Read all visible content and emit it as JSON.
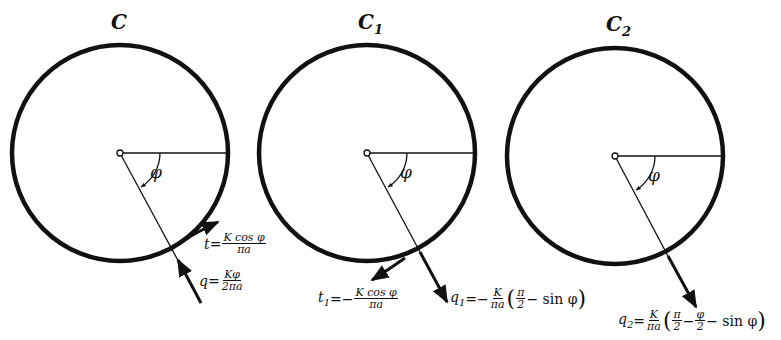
{
  "diagrams": [
    {
      "title": "C",
      "title_sub": "",
      "angle_label": "φ",
      "center": [
        120,
        153
      ],
      "radius": 108,
      "t_label": {
        "sym": "t",
        "sub": "",
        "eq": "=",
        "sign": "",
        "num": "K cos φ",
        "den": "πa"
      },
      "q_label": {
        "sym": "q",
        "sub": "",
        "eq": "=",
        "sign": "",
        "num": "Kφ",
        "den": "2πa"
      }
    },
    {
      "title": "C",
      "title_sub": "1",
      "angle_label": "φ",
      "center": [
        367,
        153
      ],
      "radius": 108,
      "t_label": {
        "sym": "t",
        "sub": "1",
        "eq": "=",
        "sign": "−",
        "num": "K cos φ",
        "den": "πa"
      },
      "q_label": {
        "sym": "q",
        "sub": "1",
        "eq": "=",
        "sign": "−",
        "num": "K",
        "den": "πa",
        "paren_open": "(",
        "inner_num": "π",
        "inner_den": "2",
        "tail": "− sin φ",
        "paren_close": ")"
      }
    },
    {
      "title": "C",
      "title_sub": "2",
      "angle_label": "φ",
      "center": [
        615,
        156
      ],
      "radius": 108,
      "q_label": {
        "sym": "q",
        "sub": "2",
        "eq": "=",
        "sign": "",
        "num": "K",
        "den": "πa",
        "paren_open": "(",
        "inner_num": "π",
        "inner_den": "2",
        "mid": "−",
        "inner2_num": "φ",
        "inner2_den": "2",
        "tail": "− sin φ",
        "paren_close": ")"
      }
    }
  ]
}
